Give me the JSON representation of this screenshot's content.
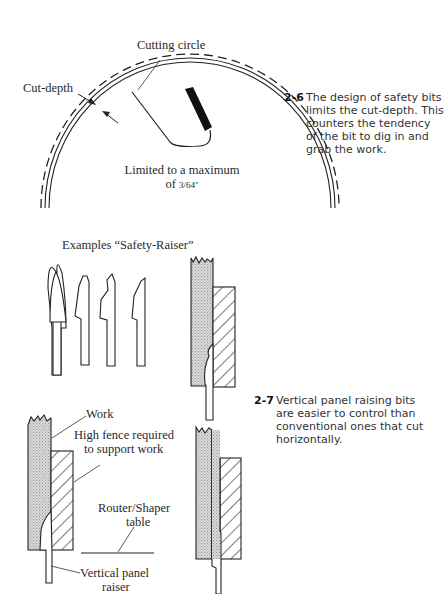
{
  "figure_2_6": {
    "labels": {
      "cutting_circle": "Cutting circle",
      "cut_depth": "Cut-depth",
      "limited_line1": "Limited to a maximum",
      "limited_line2_prefix": "of ",
      "fraction": "3/64\""
    },
    "caption": {
      "number": "2-6",
      "text": "The design of safety bits limits the cut-depth. This counters the tendency of the bit to dig in and grab the work."
    }
  },
  "figure_2_7": {
    "labels": {
      "examples_title": "Examples “Safety-Raiser”",
      "work": "Work",
      "high_fence_line1": "High fence required",
      "high_fence_line2": "to support work",
      "router_table_line1": "Router/Shaper",
      "router_table_line2": "table",
      "vertical_raiser_line1": "Vertical panel",
      "vertical_raiser_line2": "raiser"
    },
    "caption": {
      "number": "2-7",
      "text": "Vertical panel raising bits are easier to control than conventional ones that cut horizontally."
    }
  }
}
